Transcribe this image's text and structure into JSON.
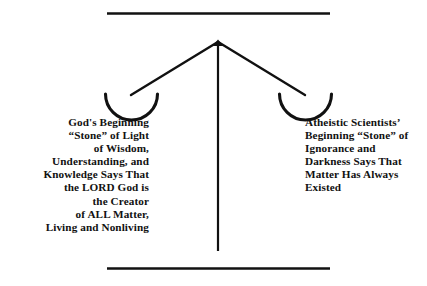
{
  "diagram": {
    "type": "balance-scale",
    "title_visible": false,
    "colors": {
      "ink": "#111111",
      "background": "#ffffff"
    },
    "structure": {
      "top_rule_label": "top-horizontal-rule",
      "bottom_rule_label": "bottom-horizontal-rule",
      "post_label": "vertical-center-post",
      "apex_label": "balance-apex-pivot",
      "left_arm_label": "left-balance-arm",
      "right_arm_label": "right-balance-arm",
      "left_pan_label": "left-balance-pan",
      "right_pan_label": "right-balance-pan"
    },
    "left_pan": {
      "caption": "God's Beginning\n“Stone” of Light\nof Wisdom,\nUnderstanding, and\nKnowledge Says That\nthe LORD God is\nthe Creator\nof ALL Matter,\nLiving and Nonliving",
      "lines": [
        "God's Beginning",
        "“Stone” of Light",
        "of Wisdom,",
        "Understanding, and",
        "Knowledge Says That",
        "the LORD God is",
        "the Creator",
        "of ALL Matter,",
        "Living and Nonliving"
      ],
      "align": "right"
    },
    "right_pan": {
      "caption": "Atheistic Scientists’\nBeginning “Stone” of\nIgnorance and\nDarkness Says That\nMatter Has Always\nExisted",
      "lines": [
        "Atheistic Scientists’",
        "Beginning “Stone” of",
        "Ignorance and",
        "Darkness Says That",
        "Matter Has Always",
        "Existed"
      ],
      "align": "left"
    }
  }
}
